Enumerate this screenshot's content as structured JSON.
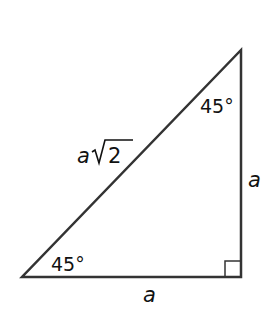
{
  "diagram": {
    "colors": {
      "stroke": "#333333",
      "text": "#111111",
      "background": "#ffffff"
    },
    "vertices": {
      "top": [
        241,
        50
      ],
      "bottom_right": [
        241,
        277
      ],
      "bottom_left": [
        22,
        277
      ]
    },
    "labels": {
      "top_angle": "45°",
      "bottom_angle": "45°",
      "hypotenuse_var": "a",
      "hypotenuse_radicand": "2",
      "vertical_leg": "a",
      "horizontal_leg": "a"
    },
    "right_angle_marker": {
      "size": 16
    }
  }
}
